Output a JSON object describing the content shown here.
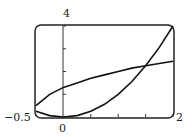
{
  "chart_data": {
    "type": "line",
    "title": "",
    "xlabel": "",
    "ylabel": "",
    "xlim": [
      -0.5,
      2
    ],
    "ylim": [
      0,
      4
    ],
    "grid": false,
    "tick_labels": {
      "x_min": "−0.5",
      "x_max": "2",
      "x_origin": "0",
      "y_max": "4"
    },
    "series": [
      {
        "name": "curve-1",
        "x": [
          -0.5,
          -0.25,
          0,
          0.25,
          0.5,
          0.75,
          1,
          1.25,
          1.5,
          1.75,
          2
        ],
        "y": [
          0.25,
          0.06,
          0,
          0.06,
          0.25,
          0.56,
          1,
          1.56,
          2.25,
          3.06,
          4
        ]
      },
      {
        "name": "curve-2",
        "x": [
          -0.5,
          -0.25,
          0,
          0.25,
          0.5,
          0.75,
          1,
          1.25,
          1.5,
          1.75,
          2
        ],
        "y": [
          0.5,
          1.0,
          1.3,
          1.5,
          1.7,
          1.85,
          2.0,
          2.15,
          2.25,
          2.35,
          2.45
        ]
      }
    ]
  }
}
